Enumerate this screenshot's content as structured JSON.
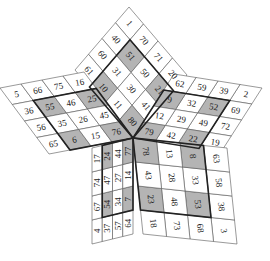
{
  "puzzle": {
    "type": "star-grid",
    "colors": {
      "shaded": "#b4b4b4",
      "cell": "#ffffff",
      "border": "#222222"
    },
    "sectors": [
      {
        "name": "top",
        "rows": [
          [
            1,
            70,
            71,
            20
          ],
          [
            40,
            51,
            50,
            21
          ],
          [
            60,
            31,
            30,
            41
          ],
          [
            61,
            10,
            11,
            80
          ]
        ],
        "shaded": [
          [
            1,
            1
          ],
          [
            1,
            3
          ],
          [
            3,
            1
          ],
          [
            3,
            3
          ]
        ]
      },
      {
        "name": "right",
        "rows": [
          [
            2,
            39,
            59,
            62
          ],
          [
            69,
            52,
            32,
            9
          ],
          [
            72,
            49,
            29,
            12
          ],
          [
            19,
            22,
            42,
            79
          ]
        ],
        "shaded": [
          [
            1,
            1
          ],
          [
            1,
            3
          ],
          [
            3,
            1
          ],
          [
            3,
            3
          ]
        ]
      },
      {
        "name": "bottom-right",
        "rows": [
          [
            3,
            38,
            58,
            63
          ],
          [
            68,
            53,
            33,
            8
          ],
          [
            73,
            48,
            28,
            13
          ],
          [
            18,
            23,
            43,
            78
          ]
        ],
        "shaded": [
          [
            1,
            1
          ],
          [
            1,
            3
          ],
          [
            3,
            1
          ],
          [
            3,
            3
          ]
        ]
      },
      {
        "name": "bottom-left",
        "rows": [
          [
            4,
            67,
            74,
            17
          ],
          [
            37,
            54,
            47,
            24
          ],
          [
            57,
            34,
            27,
            44
          ],
          [
            64,
            7,
            14,
            77
          ]
        ],
        "shaded": [
          [
            1,
            1
          ],
          [
            1,
            3
          ],
          [
            3,
            1
          ],
          [
            3,
            3
          ]
        ]
      },
      {
        "name": "left",
        "rows": [
          [
            5,
            66,
            75,
            16
          ],
          [
            36,
            55,
            46,
            25
          ],
          [
            56,
            35,
            26,
            45
          ],
          [
            65,
            6,
            15,
            76
          ]
        ],
        "shaded": [
          [
            1,
            1
          ],
          [
            1,
            3
          ],
          [
            3,
            1
          ],
          [
            3,
            3
          ]
        ]
      }
    ]
  }
}
